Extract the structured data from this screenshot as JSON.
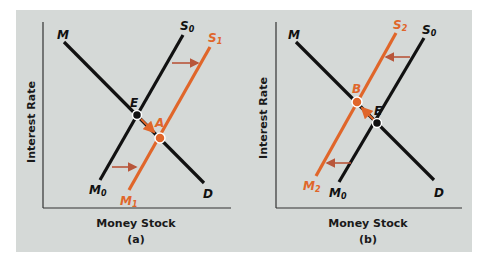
{
  "colors": {
    "background": "#d5d9d7",
    "black_line": "#111111",
    "orange_line": "#e0662a",
    "arrow": "#b8563a",
    "axis": "#333333"
  },
  "panels": [
    {
      "id": "a",
      "caption": "(a)",
      "x_axis_label": "Money Stock",
      "y_axis_label": "Interest Rate",
      "curves": [
        {
          "name": "M",
          "label": "M",
          "sub": "",
          "end_label": "D",
          "type": "demand",
          "color": "black"
        },
        {
          "name": "S0",
          "label": "S",
          "sub": "0",
          "bottom_label": "M",
          "bottom_sub": "0",
          "type": "supply",
          "color": "black"
        },
        {
          "name": "S1",
          "label": "S",
          "sub": "1",
          "bottom_label": "M",
          "bottom_sub": "1",
          "type": "supply-shifted-right",
          "color": "orange"
        }
      ],
      "points": [
        {
          "label": "E",
          "note": "initial equilibrium"
        },
        {
          "label": "A",
          "note": "new equilibrium"
        }
      ],
      "shift_direction": "right"
    },
    {
      "id": "b",
      "caption": "(b)",
      "x_axis_label": "Money Stock",
      "y_axis_label": "Interest Rate",
      "curves": [
        {
          "name": "M",
          "label": "M",
          "sub": "",
          "end_label": "D",
          "type": "demand",
          "color": "black"
        },
        {
          "name": "S0",
          "label": "S",
          "sub": "0",
          "bottom_label": "M",
          "bottom_sub": "0",
          "type": "supply",
          "color": "black"
        },
        {
          "name": "S2",
          "label": "S",
          "sub": "2",
          "bottom_label": "M",
          "bottom_sub": "2",
          "type": "supply-shifted-left",
          "color": "orange"
        }
      ],
      "points": [
        {
          "label": "B",
          "note": "new equilibrium"
        },
        {
          "label": "E",
          "note": "initial equilibrium"
        }
      ],
      "shift_direction": "left"
    }
  ]
}
